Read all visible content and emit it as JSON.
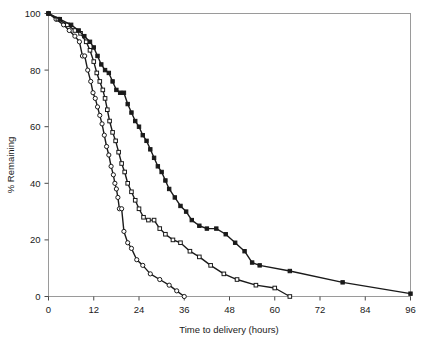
{
  "chart_data": {
    "type": "line",
    "title": "",
    "subtitle": "",
    "xlabel": "Time to delivery (hours)",
    "ylabel": "% Remaining",
    "xlim": [
      0,
      96
    ],
    "ylim": [
      0,
      100
    ],
    "xticks": [
      0,
      12,
      24,
      36,
      48,
      60,
      72,
      84,
      96
    ],
    "xtick_labels": [
      "0",
      "12",
      "24",
      "36",
      "48",
      "60",
      "72",
      "84",
      "96"
    ],
    "yticks": [
      0,
      20,
      40,
      60,
      80,
      100
    ],
    "ytick_labels": [
      "0",
      "20",
      "40",
      "60",
      "80",
      "100"
    ],
    "grid": false,
    "legend": "none",
    "plot_border": true,
    "line_color": "#1a1a1a",
    "series": [
      {
        "name": "curve-1-open-circles",
        "marker": "open-circle",
        "marker_fill": "#ffffff",
        "marker_stroke": "#1a1a1a",
        "x": [
          0,
          2,
          4,
          5.5,
          7,
          8.2,
          9,
          9.6,
          10.4,
          11.2,
          11.8,
          12.4,
          13,
          13.6,
          14.2,
          14.8,
          15.4,
          16,
          16.6,
          17.2,
          17.6,
          18,
          18.4,
          18.8,
          19.4,
          20,
          21,
          22,
          23.4,
          25,
          27,
          29.5,
          32,
          34,
          36
        ],
        "y": [
          100,
          98,
          96,
          94,
          92,
          90,
          85,
          85,
          80,
          76,
          72,
          70,
          67,
          64,
          61,
          57,
          53,
          50,
          46,
          43,
          40,
          38,
          35,
          31,
          31,
          23,
          19,
          17,
          13,
          11,
          8,
          6,
          4,
          2,
          0
        ]
      },
      {
        "name": "curve-2-open-squares",
        "marker": "open-square",
        "marker_fill": "#ffffff",
        "marker_stroke": "#1a1a1a",
        "x": [
          0,
          2.5,
          5,
          7,
          8.5,
          10,
          11,
          12,
          12.8,
          13.6,
          14.4,
          15,
          15.6,
          16.2,
          17,
          17.8,
          18.6,
          19.4,
          20.2,
          21,
          22,
          23,
          24,
          25.2,
          26.5,
          28,
          29.5,
          31,
          33,
          35,
          37.5,
          40,
          43,
          46.5,
          50,
          55,
          60,
          64
        ],
        "y": [
          100,
          98,
          96,
          94,
          93,
          90,
          87,
          83,
          79,
          76,
          73,
          70,
          66,
          62,
          58,
          55,
          51,
          47,
          44,
          40,
          37,
          34,
          31,
          28,
          27,
          27,
          24,
          22,
          20,
          19,
          16,
          14,
          11,
          8,
          6,
          4,
          3,
          0
        ]
      },
      {
        "name": "curve-3-filled-squares",
        "marker": "filled-square",
        "marker_fill": "#1a1a1a",
        "marker_stroke": "#1a1a1a",
        "x": [
          0,
          3,
          6,
          8,
          9.5,
          11,
          12,
          13,
          14,
          15,
          16,
          17,
          18,
          19,
          20,
          21,
          22,
          23,
          24,
          25,
          26,
          27,
          28,
          29,
          30,
          31,
          32,
          33.5,
          35,
          36.5,
          38,
          40,
          42,
          44.5,
          47,
          49.5,
          52,
          54,
          56,
          64,
          78,
          96
        ],
        "y": [
          100,
          98,
          96,
          94,
          92,
          90,
          88,
          85,
          82,
          80,
          79,
          76,
          73,
          72,
          72,
          68,
          65,
          62,
          60,
          57,
          55,
          52,
          49,
          46,
          44,
          41,
          38,
          35,
          32,
          30,
          27,
          25,
          24,
          24,
          22,
          19,
          16,
          12,
          11,
          9,
          5,
          1
        ]
      }
    ]
  },
  "axes": {
    "x_title": "Time to delivery (hours)",
    "y_title": "% Remaining"
  }
}
